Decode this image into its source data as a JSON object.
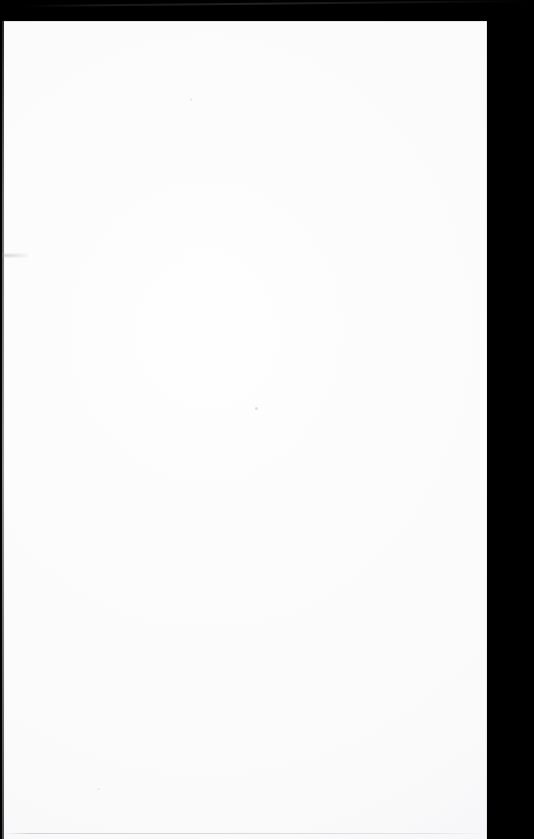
{
  "document": {
    "kind": "scanned-page",
    "description": "Blank scanned document page",
    "page_content_text": "",
    "orientation": "portrait",
    "page_width_px": 485,
    "page_height_px": 818,
    "paper_color": "#fefefe"
  },
  "scanner_background": {
    "label": "Scanner lid background",
    "color": "#000000",
    "top_band_height_px": 22,
    "right_band_width_px": 47
  },
  "artifacts": [
    {
      "name": "diagonal-streak",
      "label": "Light streak across upper black band",
      "color": "#1a1a1a"
    },
    {
      "name": "left-edge-line",
      "label": "Dark scan line along left paper edge",
      "color": "#2e2e34"
    },
    {
      "name": "left-margin-smudge",
      "label": "Faint grey smudge on left margin",
      "color": "#96969e"
    },
    {
      "name": "bottom-edge-line",
      "label": "Faint grey line near bottom of page",
      "color": "#80808a"
    },
    {
      "name": "dust-speck",
      "label": "Small dust speck near page center",
      "color": "#b2b2bc"
    }
  ]
}
